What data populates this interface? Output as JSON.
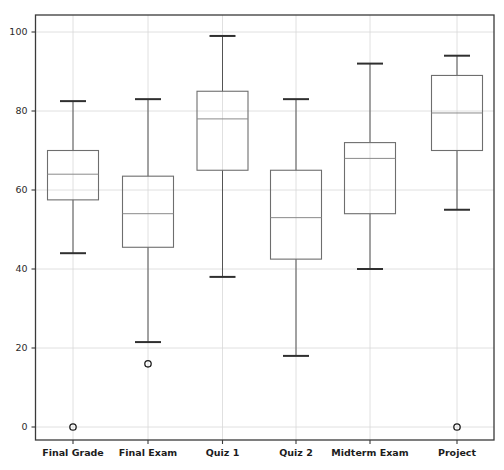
{
  "chart_data": {
    "type": "box",
    "title": "",
    "subtitle": "",
    "xlabel": "",
    "ylabel": "",
    "ylim": [
      0,
      100
    ],
    "yticks": [
      0,
      20,
      40,
      60,
      80,
      100
    ],
    "ytick_labels": [
      "0",
      "20",
      "40",
      "60",
      "80",
      "100"
    ],
    "grid": true,
    "legend": false,
    "categories": [
      "Final Grade",
      "Final Exam",
      "Quiz 1",
      "Quiz 2",
      "Midterm Exam",
      "Project"
    ],
    "boxes": [
      {
        "label": "Final Grade",
        "whisker_low": 44.0,
        "q1": 57.5,
        "median": 64.0,
        "q3": 70.0,
        "whisker_high": 82.5,
        "outliers": [
          0.0
        ]
      },
      {
        "label": "Final Exam",
        "whisker_low": 21.5,
        "q1": 45.5,
        "median": 54.0,
        "q3": 63.5,
        "whisker_high": 83.0,
        "outliers": [
          16.0
        ]
      },
      {
        "label": "Quiz 1",
        "whisker_low": 38.0,
        "q1": 65.0,
        "median": 78.0,
        "q3": 85.0,
        "whisker_high": 99.0,
        "outliers": []
      },
      {
        "label": "Quiz 2",
        "whisker_low": 18.0,
        "q1": 42.5,
        "median": 53.0,
        "q3": 65.0,
        "whisker_high": 83.0,
        "outliers": []
      },
      {
        "label": "Midterm Exam",
        "whisker_low": 40.0,
        "q1": 54.0,
        "median": 68.0,
        "q3": 72.0,
        "whisker_high": 92.0,
        "outliers": []
      },
      {
        "label": "Project",
        "whisker_low": 55.0,
        "q1": 70.0,
        "median": 79.5,
        "q3": 89.0,
        "whisker_high": 94.0,
        "outliers": [
          0.0
        ]
      }
    ],
    "colors": {
      "background": "#ffffff",
      "grid": "#d8d8d8",
      "frame": "#3a3a3a",
      "box_edge": "#6e6e6e",
      "median": "#8a8a8a",
      "whisker": "#545454",
      "cap": "#2f2f2f",
      "outlier": "#1e1e1e",
      "tick_text": "#2b2b2b"
    }
  }
}
